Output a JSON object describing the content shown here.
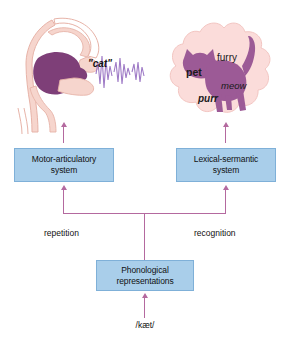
{
  "figure": {
    "colors": {
      "box_fill": "#a9ceea",
      "box_border": "#7fb0d8",
      "arrow": "#b4699f",
      "anatomy_pink": "#f4cfc9",
      "anatomy_purple": "#7e3f78",
      "cloud_fill": "#fbdcda",
      "cat_purple": "#9c5a96",
      "waveform": "#9a74c4",
      "background": "#ffffff"
    }
  },
  "boxes": {
    "motor": {
      "line1": "Motor-articulatory",
      "line2": "system"
    },
    "lexical": {
      "line1": "Lexical-sermantic",
      "line2": "system"
    },
    "phonological": {
      "line1": "Phonological",
      "line2": "representations"
    }
  },
  "pathway_labels": {
    "repetition": "repetition",
    "recognition": "recognition"
  },
  "phonetic_input": "/kæt/",
  "spoken_output": "\"cat\"",
  "semantic_cloud": {
    "words": [
      {
        "text": "furry",
        "style": "plain"
      },
      {
        "text": "pet",
        "style": "bold"
      },
      {
        "text": "meow",
        "style": "italic"
      },
      {
        "text": "purr",
        "style": "bold-italic"
      }
    ]
  },
  "icons": {
    "vocal_tract": "vocal-tract-icon",
    "sound_wave": "sound-waveform-icon",
    "semantic_cloud": "thought-cloud-icon",
    "cat": "cat-silhouette-icon",
    "arrow_up": "arrow-up-icon"
  }
}
